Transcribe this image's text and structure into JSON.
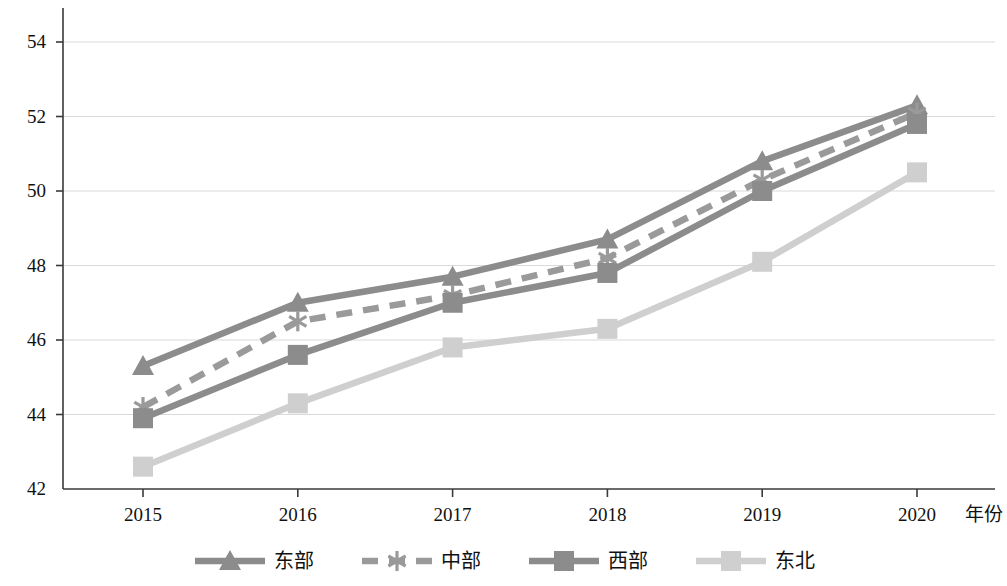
{
  "chart_data": {
    "type": "line",
    "title": "",
    "subtitle": "",
    "xlabel": "年份",
    "ylabel": "",
    "x": [
      2015,
      2016,
      2017,
      2018,
      2019,
      2020
    ],
    "categories": [
      "2015",
      "2016",
      "2017",
      "2018",
      "2019",
      "2020"
    ],
    "xlim": [
      2014.5,
      2020.5
    ],
    "ylim": [
      42,
      55
    ],
    "y_ticks": [
      42,
      44,
      46,
      48,
      50,
      52,
      54
    ],
    "y_tick_labels": [
      "42",
      "44",
      "46",
      "48",
      "50",
      "52",
      "54"
    ],
    "x_tick_labels": [
      "2015",
      "2016",
      "2017",
      "2018",
      "2019",
      "2020"
    ],
    "grid": "horizontal",
    "legend_position": "bottom",
    "series": [
      {
        "name": "东部",
        "values": [
          45.3,
          47.0,
          47.7,
          48.7,
          50.8,
          52.3
        ],
        "color": "#8c8c8c",
        "line_style": "solid",
        "marker": "triangle"
      },
      {
        "name": "中部",
        "values": [
          44.2,
          46.5,
          47.2,
          48.2,
          50.3,
          52.1
        ],
        "color": "#9a9a9a",
        "line_style": "dashed",
        "marker": "asterisk"
      },
      {
        "name": "西部",
        "values": [
          43.9,
          45.6,
          47.0,
          47.8,
          50.0,
          51.8
        ],
        "color": "#8c8c8c",
        "line_style": "solid",
        "marker": "square"
      },
      {
        "name": "东北",
        "values": [
          42.6,
          44.3,
          45.8,
          46.3,
          48.1,
          50.5
        ],
        "color": "#cfcfcf",
        "line_style": "solid",
        "marker": "square"
      }
    ]
  },
  "axes": {
    "x_axis_title": "年份"
  },
  "legend": {
    "items": [
      {
        "label": "东部"
      },
      {
        "label": "中部"
      },
      {
        "label": "西部"
      },
      {
        "label": "东北"
      }
    ]
  },
  "colors": {
    "series_dark": "#8c8c8c",
    "series_mid": "#9a9a9a",
    "series_light": "#cfcfcf",
    "axis": "#3a3a3a",
    "grid": "#d9d9d9",
    "text": "#111111",
    "background": "#ffffff"
  }
}
